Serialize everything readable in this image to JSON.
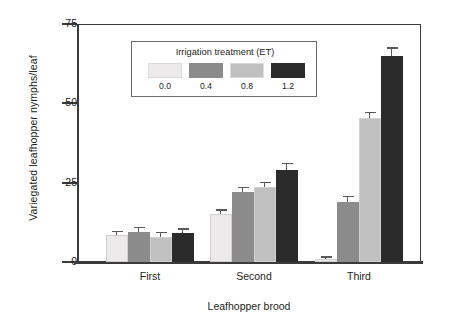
{
  "chart_data": {
    "type": "bar",
    "title": "",
    "xlabel": "Leafhopper brood",
    "ylabel": "Variegated leafhopper nymphs/leaf",
    "categories": [
      "First",
      "Second",
      "Third"
    ],
    "ylim": [
      0,
      75
    ],
    "yticks": [
      0,
      25,
      50,
      75
    ],
    "ytick_labels": [
      "0",
      "25",
      "50",
      "75"
    ],
    "grid": false,
    "legend_position": "inside-top-center",
    "legend_title": "Irrigation treatment (ET)",
    "series": [
      {
        "name": "0.0",
        "color": "#eceaea",
        "values": [
          8.5,
          15.0,
          1.0
        ],
        "errors": [
          1.0,
          1.2,
          0.4
        ]
      },
      {
        "name": "0.4",
        "color": "#8b8b8b",
        "values": [
          9.5,
          22.0,
          19.0
        ],
        "errors": [
          1.1,
          1.3,
          1.4
        ]
      },
      {
        "name": "0.8",
        "color": "#c0c0c0",
        "values": [
          8.0,
          23.5,
          45.5
        ],
        "errors": [
          1.0,
          1.4,
          1.5
        ]
      },
      {
        "name": "1.2",
        "color": "#2b2b2b",
        "values": [
          9.0,
          29.0,
          65.0
        ],
        "errors": [
          1.2,
          1.8,
          2.2
        ]
      }
    ]
  },
  "axis": {
    "y_title": "Variegated leafhopper nymphs/leaf",
    "x_title": "Leafhopper brood"
  },
  "legend": {
    "title": "Irrigation treatment (ET)",
    "items": [
      {
        "label": "0.0",
        "color": "#eceaea"
      },
      {
        "label": "0.4",
        "color": "#8b8b8b"
      },
      {
        "label": "0.8",
        "color": "#c0c0c0"
      },
      {
        "label": "1.2",
        "color": "#2b2b2b"
      }
    ]
  },
  "colors": {
    "axis": "#3b3b3b",
    "text": "#231f20",
    "error_bar": "#595959",
    "legend_border": "#6d6d6d",
    "background": "#ffffff"
  }
}
